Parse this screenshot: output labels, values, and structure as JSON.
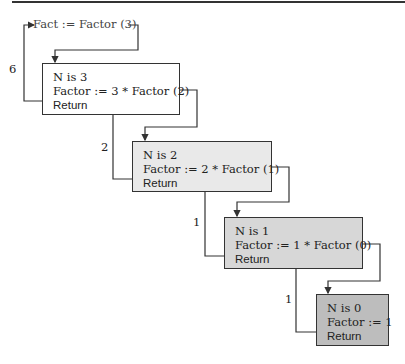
{
  "call": "Fact := Factor (3)",
  "frames": [
    {
      "n_line": "N is 3",
      "factor_line": "Factor := 3 * Factor (2)",
      "return_line": "Return",
      "fill": "#ffffff"
    },
    {
      "n_line": "N is 2",
      "factor_line": "Factor := 2 * Factor (1)",
      "return_line": "Return",
      "fill": "#e9e9e9"
    },
    {
      "n_line": "N is 1",
      "factor_line": "Factor := 1 * Factor (0)",
      "return_line": "Return",
      "fill": "#d7d7d7"
    },
    {
      "n_line": "N is 0",
      "factor_line": "Factor := 1",
      "return_line": "Return",
      "fill": "#bdbdbd"
    }
  ],
  "return_values": [
    "6",
    "2",
    "1",
    "1"
  ]
}
